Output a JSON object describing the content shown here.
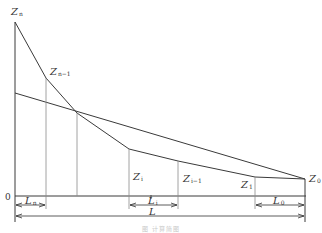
{
  "diagram": {
    "labels": {
      "zn": {
        "main": "Z",
        "sub": "n"
      },
      "zn_1": {
        "main": "Z",
        "sub": "n−1"
      },
      "zi": {
        "main": "Z",
        "sub": "i"
      },
      "zi_1": {
        "main": "Z",
        "sub": "i−1"
      },
      "z1": {
        "main": "Z",
        "sub": "1"
      },
      "z0": {
        "main": "Z",
        "sub": "0"
      },
      "origin": "0",
      "ln": {
        "main": "L",
        "sub": "n"
      },
      "li": {
        "main": "L",
        "sub": "i"
      },
      "l0": {
        "main": "L",
        "sub": "0"
      },
      "l_total": "L"
    },
    "caption": "图    计算简图",
    "colors": {
      "line": "#3a3a3a",
      "thin_line": "#8a8a8a",
      "text": "#333333"
    }
  }
}
